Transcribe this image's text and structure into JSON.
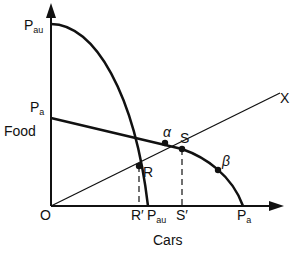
{
  "diagram": {
    "type": "production-possibility-frontier",
    "axes": {
      "y_label": "Food",
      "x_label": "Cars",
      "origin_label": "O"
    },
    "y_axis_labels": [
      {
        "id": "pau_y",
        "main": "P",
        "sub": "au"
      },
      {
        "id": "pa_y",
        "main": "P",
        "sub": "a"
      }
    ],
    "x_axis_labels": [
      {
        "id": "r_prime",
        "text": "R′"
      },
      {
        "id": "pau_x",
        "main": "P",
        "sub": "au"
      },
      {
        "id": "s_prime",
        "text": "S′"
      },
      {
        "id": "pa_x",
        "main": "P",
        "sub": "a"
      }
    ],
    "points": [
      {
        "id": "R",
        "label": "R"
      },
      {
        "id": "S",
        "label": "S"
      },
      {
        "id": "alpha",
        "label": "α"
      },
      {
        "id": "beta",
        "label": "β"
      }
    ],
    "ray_label": "X",
    "colors": {
      "stroke": "#111111",
      "background": "#ffffff"
    }
  }
}
